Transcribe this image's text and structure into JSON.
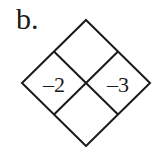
{
  "problem": {
    "label": "b.",
    "diamond": {
      "top": "",
      "left": "–2",
      "right": "–3",
      "bottom": ""
    },
    "line_color": "#1a1a1a"
  }
}
